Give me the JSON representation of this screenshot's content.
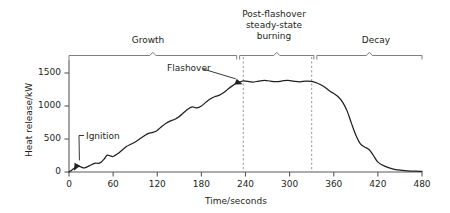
{
  "figure": {
    "background": "#ffffff",
    "ink_color": "#231f20",
    "curve_color": "#231f20",
    "guide_color": "#8c8c8c"
  },
  "axes": {
    "y_title": "Heat release/kW",
    "x_title": "Time/seconds",
    "y_ticks": [
      "0",
      "500",
      "1000",
      "1500"
    ],
    "x_ticks": [
      "0",
      "60",
      "120",
      "180",
      "240",
      "300",
      "360",
      "420",
      "480"
    ]
  },
  "annotations": [
    {
      "name": "ignition",
      "label": "Ignition"
    },
    {
      "name": "flashover",
      "label": "Flashover"
    }
  ],
  "phases": [
    {
      "name": "growth",
      "label": "Growth"
    },
    {
      "name": "post-flashover-steady-state-burning",
      "label": "Post-flashover\nsteady-state\nburning",
      "line1": "Post-flashover",
      "line2": "steady-state",
      "line3": "burning"
    },
    {
      "name": "decay",
      "label": "Decay"
    }
  ],
  "markers": {
    "flashover_time": 237,
    "decay_start_time": 330
  },
  "chart_data": {
    "type": "line",
    "title": "",
    "xlabel": "Time/seconds",
    "ylabel": "Heat release/kW",
    "xlim": [
      0,
      480
    ],
    "ylim": [
      0,
      1700
    ],
    "xticks": [
      0,
      60,
      120,
      180,
      240,
      300,
      360,
      420,
      480
    ],
    "yticks": [
      0,
      500,
      1000,
      1500
    ],
    "grid": false,
    "legend": null,
    "annotations": [
      {
        "text": "Ignition",
        "x": 5,
        "y": 30
      },
      {
        "text": "Flashover",
        "x": 237,
        "y": 1360
      },
      {
        "text": "Growth",
        "span_x": [
          0,
          228
        ]
      },
      {
        "text": "Post-flashover steady-state burning",
        "span_x": [
          232,
          333
        ]
      },
      {
        "text": "Decay",
        "span_x": [
          337,
          480
        ]
      }
    ],
    "vertical_dashed_lines": [
      237,
      330
    ],
    "series": [
      {
        "name": "Heat release rate",
        "x": [
          0,
          4,
          8,
          12,
          16,
          20,
          24,
          28,
          32,
          36,
          40,
          44,
          48,
          52,
          56,
          60,
          66,
          72,
          78,
          84,
          90,
          96,
          102,
          108,
          114,
          120,
          126,
          132,
          138,
          144,
          150,
          156,
          162,
          168,
          174,
          180,
          186,
          192,
          198,
          204,
          210,
          216,
          222,
          228,
          234,
          237,
          243,
          250,
          258,
          266,
          274,
          282,
          290,
          298,
          306,
          314,
          322,
          330,
          338,
          346,
          354,
          360,
          366,
          372,
          378,
          384,
          390,
          396,
          402,
          408,
          414,
          420,
          430,
          440,
          450,
          460,
          470,
          480
        ],
        "y": [
          0,
          30,
          65,
          85,
          78,
          62,
          75,
          95,
          118,
          135,
          130,
          150,
          200,
          255,
          245,
          235,
          275,
          330,
          385,
          420,
          455,
          500,
          545,
          585,
          600,
          630,
          690,
          740,
          775,
          800,
          840,
          900,
          955,
          985,
          970,
          1000,
          1055,
          1105,
          1140,
          1160,
          1200,
          1255,
          1305,
          1345,
          1370,
          1380,
          1372,
          1362,
          1378,
          1390,
          1376,
          1368,
          1380,
          1388,
          1374,
          1366,
          1378,
          1372,
          1345,
          1300,
          1230,
          1190,
          1140,
          1060,
          930,
          740,
          560,
          430,
          380,
          340,
          250,
          150,
          85,
          48,
          28,
          18,
          12,
          8
        ]
      }
    ]
  }
}
